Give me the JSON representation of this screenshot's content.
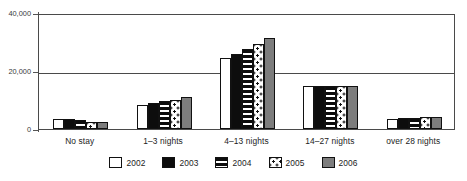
{
  "chart_data": {
    "type": "bar",
    "title": "",
    "subtitle": "",
    "xlabel": "",
    "ylabel": "",
    "ylim": [
      0,
      40000
    ],
    "yticks": [
      0,
      20000,
      40000
    ],
    "ytick_labels": [
      "0",
      "20,000",
      "40,000"
    ],
    "grid": true,
    "legend_position": "bottom",
    "categories": [
      "No stay",
      "1–3 nights",
      "4–13 nights",
      "14–27 nights",
      "over 28 nights"
    ],
    "series": [
      {
        "name": "2002",
        "swatch": "white",
        "color": "#ffffff",
        "values": [
          3600,
          8200,
          24500,
          14800,
          3500
        ]
      },
      {
        "name": "2003",
        "swatch": "black",
        "color": "#0d0d0d",
        "values": [
          3500,
          8900,
          25800,
          14700,
          3700
        ]
      },
      {
        "name": "2004",
        "swatch": "horizontal-stripes",
        "color": "#0d0d0d",
        "values": [
          3200,
          9700,
          27700,
          14700,
          3800
        ]
      },
      {
        "name": "2005",
        "swatch": "dotted",
        "color": "#ffffff",
        "values": [
          2400,
          10000,
          29400,
          14700,
          4000
        ]
      },
      {
        "name": "2006",
        "swatch": "gray",
        "color": "#7d7d7d",
        "values": [
          2300,
          11000,
          31500,
          14800,
          4300
        ]
      }
    ]
  },
  "legend": {
    "items": [
      {
        "label": "2002"
      },
      {
        "label": "2003"
      },
      {
        "label": "2004"
      },
      {
        "label": "2005"
      },
      {
        "label": "2006"
      }
    ]
  },
  "colors": {
    "axis": "#4a4a4a",
    "bar_outline": "#111111",
    "gray_series": "#7d7d7d",
    "black_series": "#0d0d0d",
    "background": "#ffffff"
  }
}
